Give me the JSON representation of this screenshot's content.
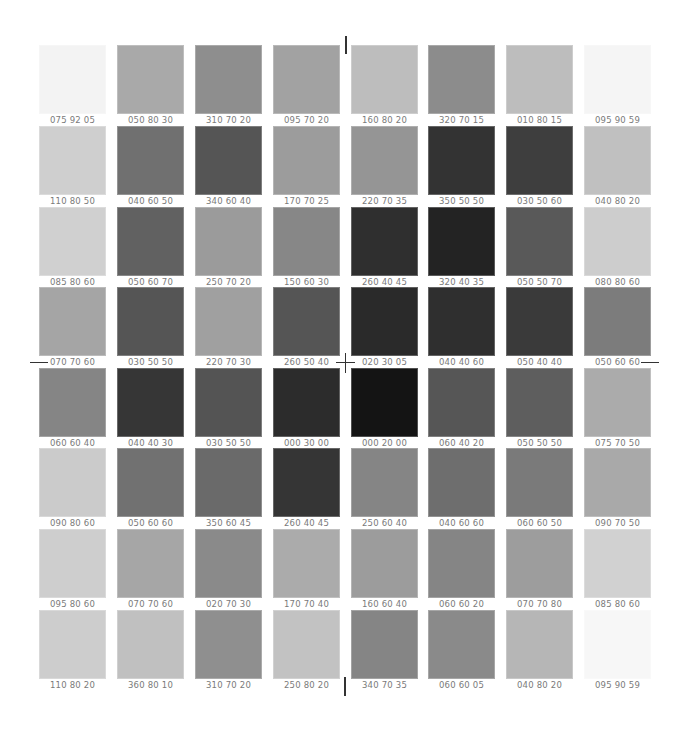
{
  "colors": {
    "background": "#ffffff",
    "label": "#7a7a7a",
    "registration_mark": "#333333"
  },
  "grid": {
    "columns": 8,
    "rows": 8,
    "rows_data": [
      [
        {
          "code": "075 92 05",
          "gray": "#f3f3f3"
        },
        {
          "code": "050 80 30",
          "gray": "#a9a9a9"
        },
        {
          "code": "310 70 20",
          "gray": "#8e8e8e"
        },
        {
          "code": "095 70 20",
          "gray": "#a2a2a2"
        },
        {
          "code": "160 80 20",
          "gray": "#bdbdbd"
        },
        {
          "code": "320 70 15",
          "gray": "#8c8c8c"
        },
        {
          "code": "010 80 15",
          "gray": "#bdbdbd"
        },
        {
          "code": "095 90 59",
          "gray": "#f5f5f5"
        }
      ],
      [
        {
          "code": "110 80 50",
          "gray": "#cfcfcf"
        },
        {
          "code": "040 60 50",
          "gray": "#707070"
        },
        {
          "code": "340 60 40",
          "gray": "#555555"
        },
        {
          "code": "170 70 25",
          "gray": "#9c9c9c"
        },
        {
          "code": "220 70 35",
          "gray": "#959595"
        },
        {
          "code": "350 50 50",
          "gray": "#333333"
        },
        {
          "code": "030 50 60",
          "gray": "#3e3e3e"
        },
        {
          "code": "040 80 20",
          "gray": "#c0c0c0"
        }
      ],
      [
        {
          "code": "085 80 60",
          "gray": "#d0d0d0"
        },
        {
          "code": "050 60 70",
          "gray": "#616161"
        },
        {
          "code": "250 70 20",
          "gray": "#9b9b9b"
        },
        {
          "code": "150 60 30",
          "gray": "#878787"
        },
        {
          "code": "260 40 45",
          "gray": "#2f2f2f"
        },
        {
          "code": "320 40 35",
          "gray": "#232323"
        },
        {
          "code": "050 50 70",
          "gray": "#595959"
        },
        {
          "code": "080 80 60",
          "gray": "#cdcdcd"
        }
      ],
      [
        {
          "code": "070 70 60",
          "gray": "#a5a5a5"
        },
        {
          "code": "030 50 50",
          "gray": "#555555"
        },
        {
          "code": "220 70 30",
          "gray": "#a0a0a0"
        },
        {
          "code": "260 50 40",
          "gray": "#555555"
        },
        {
          "code": "020 30 05",
          "gray": "#2a2a2a"
        },
        {
          "code": "040 40 60",
          "gray": "#2f2f2f"
        },
        {
          "code": "050 40 40",
          "gray": "#3a3a3a"
        },
        {
          "code": "050 60 60",
          "gray": "#7c7c7c"
        }
      ],
      [
        {
          "code": "060 60 40",
          "gray": "#858585"
        },
        {
          "code": "040 40 30",
          "gray": "#363636"
        },
        {
          "code": "030 50 50",
          "gray": "#545454"
        },
        {
          "code": "000 30 00",
          "gray": "#2c2c2c"
        },
        {
          "code": "000 20 00",
          "gray": "#141414"
        },
        {
          "code": "060 40 20",
          "gray": "#565656"
        },
        {
          "code": "050 50 50",
          "gray": "#5e5e5e"
        },
        {
          "code": "075 70 50",
          "gray": "#ababab"
        }
      ],
      [
        {
          "code": "090 80 60",
          "gray": "#cbcbcb"
        },
        {
          "code": "050 60 60",
          "gray": "#717171"
        },
        {
          "code": "350 60 45",
          "gray": "#6a6a6a"
        },
        {
          "code": "260 40 45",
          "gray": "#353535"
        },
        {
          "code": "250 60 40",
          "gray": "#858585"
        },
        {
          "code": "040 60 60",
          "gray": "#6e6e6e"
        },
        {
          "code": "060 60 50",
          "gray": "#7a7a7a"
        },
        {
          "code": "090 70 50",
          "gray": "#a9a9a9"
        }
      ],
      [
        {
          "code": "095 80 60",
          "gray": "#cecece"
        },
        {
          "code": "070 70 60",
          "gray": "#a6a6a6"
        },
        {
          "code": "020 70 30",
          "gray": "#8a8a8a"
        },
        {
          "code": "170 70 40",
          "gray": "#ababab"
        },
        {
          "code": "160 60 40",
          "gray": "#9c9c9c"
        },
        {
          "code": "060 60 20",
          "gray": "#858585"
        },
        {
          "code": "070 70 80",
          "gray": "#9d9d9d"
        },
        {
          "code": "085 80 60",
          "gray": "#d1d1d1"
        }
      ],
      [
        {
          "code": "110 80 20",
          "gray": "#cdcdcd"
        },
        {
          "code": "360 80 10",
          "gray": "#c0c0c0"
        },
        {
          "code": "310 70 20",
          "gray": "#8f8f8f"
        },
        {
          "code": "250 80 20",
          "gray": "#c2c2c2"
        },
        {
          "code": "340 70 35",
          "gray": "#858585"
        },
        {
          "code": "060 60 05",
          "gray": "#8a8a8a"
        },
        {
          "code": "040 80 20",
          "gray": "#b6b6b6"
        },
        {
          "code": "095 90 59",
          "gray": "#f7f7f7"
        }
      ]
    ]
  },
  "registration_marks": [
    "top-tick",
    "bottom-tick",
    "left-tick",
    "right-tick",
    "center-cross"
  ]
}
